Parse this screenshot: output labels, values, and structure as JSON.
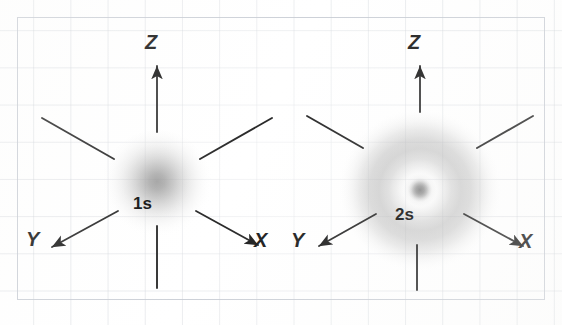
{
  "figure": {
    "width": 562,
    "height": 325,
    "background_color": "#ffffff",
    "grid_color": "#c8cdd4",
    "border_color": "#c4c9d1",
    "ink_color": "#1c1c1c",
    "orbital_color": "#8a8a8a"
  },
  "diagrams": [
    {
      "id": "1s",
      "orbital_label": "1s",
      "orbital_type": "s",
      "shell_number": 1,
      "radial_nodes": 0,
      "center": {
        "x": 157,
        "y": 186
      },
      "radius": 49,
      "axes": [
        {
          "name": "z",
          "label": "Z",
          "direction": "up",
          "arrow": true
        },
        {
          "name": "z-negative",
          "label": "",
          "direction": "down",
          "arrow": false
        },
        {
          "name": "x",
          "label": "X",
          "direction": "lower-right",
          "arrow": true
        },
        {
          "name": "y",
          "label": "Y",
          "direction": "lower-left",
          "arrow": true
        },
        {
          "name": "upper-left",
          "label": "",
          "direction": "upper-left",
          "arrow": false
        },
        {
          "name": "upper-right",
          "label": "",
          "direction": "upper-right",
          "arrow": false
        }
      ]
    },
    {
      "id": "2s",
      "orbital_label": "2s",
      "orbital_type": "s",
      "shell_number": 2,
      "radial_nodes": 1,
      "center": {
        "x": 420,
        "y": 190
      },
      "radius": 73,
      "axes": [
        {
          "name": "z",
          "label": "Z",
          "direction": "up",
          "arrow": true
        },
        {
          "name": "z-negative",
          "label": "",
          "direction": "down",
          "arrow": false
        },
        {
          "name": "x",
          "label": "X",
          "direction": "lower-right",
          "arrow": true
        },
        {
          "name": "y",
          "label": "Y",
          "direction": "lower-left",
          "arrow": true
        },
        {
          "name": "upper-left",
          "label": "",
          "direction": "upper-left",
          "arrow": false
        },
        {
          "name": "upper-right",
          "label": "",
          "direction": "upper-right",
          "arrow": false
        }
      ]
    }
  ],
  "labels": {
    "left_z": "Z",
    "left_x": "X",
    "left_y": "Y",
    "left_orbital": "1s",
    "right_z": "Z",
    "right_x": "X",
    "right_y": "Y",
    "right_orbital": "2s"
  }
}
